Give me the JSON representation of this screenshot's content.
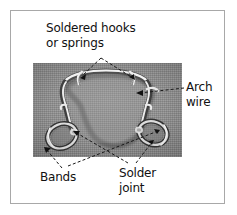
{
  "figure": {
    "kind": "labeled-photograph",
    "frame_color": "#a8a8a8",
    "background_color": "#ffffff",
    "text_color": "#111111",
    "photo": {
      "tone": "grayscale",
      "base_color": "#909090",
      "wire_highlight_color": "#f2f2f2",
      "wire_shadow_color": "#4a4a4a"
    }
  },
  "labels": {
    "soldered_hooks": {
      "line1": "Soldered hooks",
      "line2": "or springs"
    },
    "arch_wire": {
      "line1": "Arch",
      "line2": "wire"
    },
    "bands": {
      "line1": "Bands"
    },
    "solder_joint": {
      "line1": "Solder",
      "line2": "joint"
    }
  },
  "leaders": {
    "style": "dashed",
    "arrowheads": 6,
    "color": "#1a1a1a"
  }
}
